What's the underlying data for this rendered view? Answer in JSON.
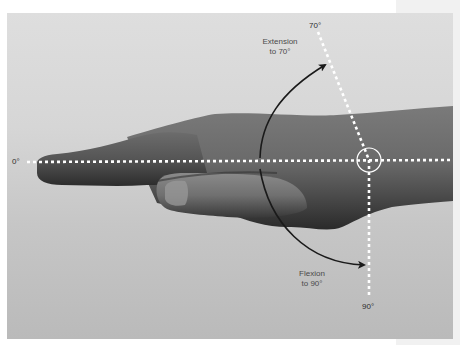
{
  "diagram": {
    "reference_lines": {
      "neutral": {
        "label": "0°",
        "angle_deg": 0
      },
      "extension_limit": {
        "label": "70°",
        "angle_deg": 70
      },
      "flexion_limit": {
        "label": "90°",
        "angle_deg": 90
      }
    },
    "annotations": {
      "extension": {
        "line1": "Extension",
        "line2": "to 70°"
      },
      "flexion": {
        "line1": "Flexion",
        "line2": "to 90°"
      }
    },
    "markers": {
      "axis_point": "wrist-joint-circle"
    },
    "colors": {
      "background_top": "#dedede",
      "background_bottom": "#bababa",
      "skin_dark": "#3c3c3c",
      "skin_mid": "#6e6e6e",
      "guide_lines": "#ffffff",
      "arrows": "#1a1a1a",
      "label_text": "#4a4a4a"
    }
  }
}
